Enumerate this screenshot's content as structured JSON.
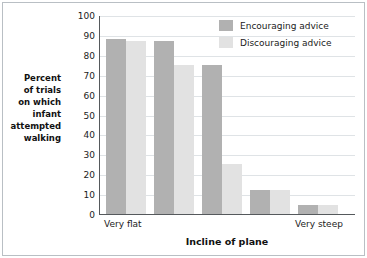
{
  "chart_data": {
    "type": "bar",
    "title": "",
    "xlabel": "Incline of plane",
    "ylabel": "Percent of trials on which infant attempted walking",
    "ylim": [
      0,
      100
    ],
    "ytick_step": 10,
    "yticks": [
      "100",
      "90",
      "80",
      "70",
      "60",
      "50",
      "40",
      "30",
      "20",
      "10",
      "0"
    ],
    "grid": true,
    "legend_position": "top-right",
    "categories": [
      "Very flat",
      "",
      "",
      "",
      "Very steep"
    ],
    "xtick_labels": [
      "Very flat",
      "Very steep"
    ],
    "series": [
      {
        "name": "Encouraging advice",
        "color": "#b1b1b1",
        "values": [
          88,
          87,
          75,
          12,
          4.5
        ]
      },
      {
        "name": "Discouraging advice",
        "color": "#e2e2e2",
        "values": [
          87,
          75,
          25,
          12,
          4.5
        ]
      }
    ]
  },
  "axes": {
    "y_title_lines": [
      "Percent",
      "of trials",
      "on which",
      "infant",
      "attempted",
      "walking"
    ],
    "x_title": "Incline of plane",
    "x_tick_left": "Very flat",
    "x_tick_right": "Very steep"
  },
  "legend": {
    "items": [
      {
        "label": "Encouraging advice",
        "color": "#b1b1b1"
      },
      {
        "label": "Discouraging advice",
        "color": "#e2e2e2"
      }
    ]
  },
  "colors": {
    "encouraging": "#b1b1b1",
    "discouraging": "#e2e2e2",
    "axis": "#55595c",
    "grid": "#dfe3e6",
    "frame": "#b9bfc4",
    "text": "#1b1b1b"
  }
}
